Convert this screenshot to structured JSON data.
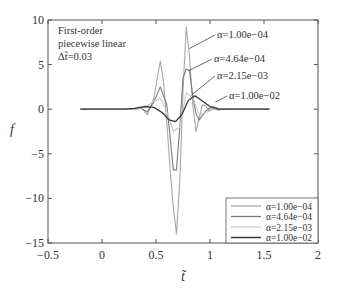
{
  "chart_data": {
    "type": "line",
    "title": "",
    "xlabel": "t̃",
    "ylabel": "f",
    "xlim": [
      -0.5,
      2
    ],
    "ylim": [
      -15,
      10
    ],
    "xticks": [
      -0.5,
      0,
      0.5,
      1,
      1.5,
      2
    ],
    "xtick_labels": [
      "−0.5",
      "0",
      "0.5",
      "1",
      "1.5",
      "2"
    ],
    "yticks": [
      -15,
      -10,
      -5,
      0,
      5,
      10
    ],
    "ytick_labels": [
      "−15",
      "−10",
      "−5",
      "0",
      "5",
      "10"
    ],
    "grid": false,
    "legend_position": "lower right",
    "annotation_box": [
      "First-order",
      "piecewise linear",
      "Δt̃=0.03"
    ],
    "series": [
      {
        "name": "α=1.00e−04",
        "color": "#a8a8a8",
        "width": 1.1,
        "x": [
          -0.2,
          0.3,
          0.36,
          0.42,
          0.48,
          0.54,
          0.57,
          0.6,
          0.63,
          0.66,
          0.69,
          0.72,
          0.75,
          0.78,
          0.81,
          0.84,
          0.87,
          0.9,
          0.93,
          0.96,
          0.99,
          1.02,
          1.08,
          1.14,
          1.2,
          1.55
        ],
        "y": [
          0,
          0,
          0.2,
          -0.6,
          1.2,
          5.4,
          3.0,
          -1.5,
          -6.5,
          -11.0,
          -14.0,
          -8.0,
          2.0,
          9.2,
          6.0,
          0.5,
          -2.5,
          -1.0,
          0.5,
          0.4,
          -0.2,
          0.1,
          -0.1,
          0.05,
          0,
          0
        ]
      },
      {
        "name": "α=4.64e−04",
        "color": "#7a7a7a",
        "width": 1.1,
        "x": [
          -0.2,
          0.3,
          0.36,
          0.42,
          0.48,
          0.54,
          0.6,
          0.63,
          0.66,
          0.69,
          0.72,
          0.75,
          0.78,
          0.81,
          0.84,
          0.87,
          0.9,
          0.96,
          1.02,
          1.1,
          1.2,
          1.55
        ],
        "y": [
          0,
          0,
          0.1,
          -0.3,
          0.8,
          2.5,
          0.5,
          -3.0,
          -6.8,
          -6.8,
          -2.0,
          3.5,
          4.5,
          4.3,
          1.5,
          -0.5,
          -1.2,
          -0.2,
          0.3,
          0,
          0,
          0
        ]
      },
      {
        "name": "α=2.15e−03",
        "color": "#c8c8c8",
        "width": 1.1,
        "x": [
          -0.2,
          0.3,
          0.4,
          0.48,
          0.54,
          0.6,
          0.66,
          0.72,
          0.78,
          0.84,
          0.9,
          0.96,
          1.05,
          1.15,
          1.55
        ],
        "y": [
          0,
          0,
          0.2,
          0.9,
          1.2,
          -0.2,
          -2.5,
          -2.0,
          1.8,
          1.3,
          -0.6,
          -0.4,
          0.1,
          0,
          0
        ]
      },
      {
        "name": "α=1.00e−02",
        "color": "#383838",
        "width": 1.3,
        "x": [
          -0.2,
          0.2,
          0.3,
          0.4,
          0.48,
          0.56,
          0.62,
          0.68,
          0.74,
          0.8,
          0.86,
          0.92,
          1.0,
          1.08,
          1.2,
          1.55
        ],
        "y": [
          0,
          0,
          0.1,
          0.3,
          0.2,
          -0.4,
          -1.2,
          -1.4,
          -0.6,
          1.0,
          1.5,
          1.0,
          0.3,
          0,
          0,
          0
        ]
      }
    ],
    "callouts": [
      {
        "label": "α=1.00e−04",
        "x_at": 0.81,
        "y_at": 6.8
      },
      {
        "label": "α=4.64e−04",
        "x_at": 0.8,
        "y_at": 4.3
      },
      {
        "label": "α=2.15e−03",
        "x_at": 0.83,
        "y_at": 1.6
      },
      {
        "label": "α=1.00e−02",
        "x_at": 1.05,
        "y_at": 0.8
      }
    ]
  }
}
